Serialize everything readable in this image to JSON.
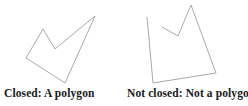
{
  "page": {
    "background": "#ffffff",
    "stroke_color": "#aaaaaa",
    "stroke_width": 1,
    "text_color": "#1a1a1a"
  },
  "figures": [
    {
      "name": "closed-polygon",
      "caption": "Closed: A polygon",
      "shape": {
        "type": "polygon",
        "closed": true,
        "points": [
          [
            95,
            16
          ],
          [
            55,
            49
          ],
          [
            43,
            29
          ],
          [
            26,
            58
          ],
          [
            65,
            83
          ]
        ]
      }
    },
    {
      "name": "open-shape",
      "caption": "Not closed: Not a polygon",
      "shape": {
        "type": "polyline",
        "closed": false,
        "points": [
          [
            147,
            17
          ],
          [
            153,
            83
          ],
          [
            216,
            73
          ],
          [
            191,
            5
          ],
          [
            178,
            36
          ],
          [
            162,
            27
          ]
        ]
      }
    }
  ]
}
